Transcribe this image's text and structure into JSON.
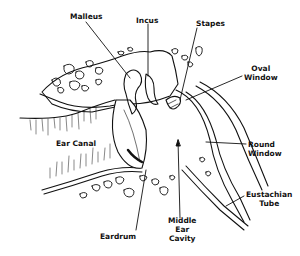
{
  "diagram": {
    "ink_color": "#111111",
    "background": "#ffffff",
    "labels": [
      {
        "id": "malleus",
        "text": "Malleus"
      },
      {
        "id": "incus",
        "text": "Incus"
      },
      {
        "id": "stapes",
        "text": "Stapes"
      },
      {
        "id": "oval-window",
        "text": "Oval\nWindow"
      },
      {
        "id": "ear-canal",
        "text": "Ear Canal"
      },
      {
        "id": "round-window",
        "text": "Round\nWindow"
      },
      {
        "id": "eustachian-tube",
        "text": "Eustachian\nTube"
      },
      {
        "id": "eardrum",
        "text": "Eardrum"
      },
      {
        "id": "middle-ear-cavity",
        "text": "Middle\nEar\nCavity"
      }
    ]
  }
}
